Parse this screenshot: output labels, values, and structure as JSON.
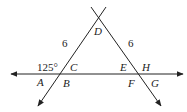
{
  "diagram": {
    "points": {
      "D": "D",
      "C": "C",
      "E": "E",
      "H": "H",
      "A": "A",
      "B": "B",
      "F": "F",
      "G": "G"
    },
    "side_labels": {
      "DC": "6",
      "DE": "6"
    },
    "angle_label": "125°",
    "colors": {
      "line": "#222222",
      "text": "#222222"
    }
  }
}
